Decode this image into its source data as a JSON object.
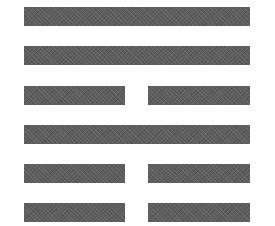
{
  "figure": {
    "type": "hexagram",
    "line_color": "#5e5e5e",
    "background": "#ffffff",
    "lines_top_to_bottom": [
      {
        "index": 1,
        "kind": "solid"
      },
      {
        "index": 2,
        "kind": "solid"
      },
      {
        "index": 3,
        "kind": "broken"
      },
      {
        "index": 4,
        "kind": "solid"
      },
      {
        "index": 5,
        "kind": "broken"
      },
      {
        "index": 6,
        "kind": "broken"
      }
    ]
  }
}
